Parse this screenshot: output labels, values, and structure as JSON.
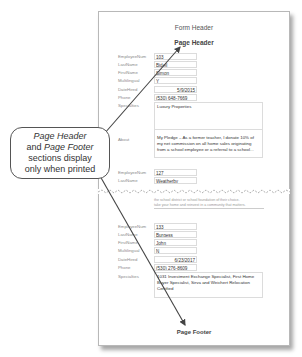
{
  "form": {
    "form_header": "Form Header",
    "page_header": "Page Header",
    "page_footer": "Page Footer"
  },
  "field_labels": {
    "employee_num": "EmployeeNum",
    "last_name": "LastName",
    "first_name": "FirstName",
    "multilingual": "Multilingual",
    "date_hired": "DateHired",
    "phone": "Phone",
    "specialties": "Specialties",
    "about": "About"
  },
  "records": [
    {
      "employee_num": "103",
      "last_name": "Bidell",
      "first_name": "Simon",
      "multilingual": "Y",
      "date_hired": "5/9/2015",
      "phone": "(530) 648-7669",
      "specialties": "Luxury Properties",
      "about": "My Pledge – As a former teacher, I donate 10% of my net commission on all home sales originating from a school employee or a referral to a school..."
    },
    {
      "employee_num": "127",
      "last_name": "Weatherby",
      "first_name": "Holly"
    },
    {
      "employee_num": "133",
      "last_name": "Burgess",
      "first_name": "John",
      "multilingual": "N",
      "date_hired": "6/23/2017",
      "phone": "(530) 276-8609",
      "specialties": "1031 Investment Exchange Specialist, First Home Buyer Specialist, Sirva and Weichert Relocation Certified"
    }
  ],
  "partial_text": {
    "line1": "the school district or school foundation of their choice.",
    "line2": "take your home and reinvest in a community that matters."
  },
  "callout": {
    "line1_italic": "Page Header",
    "line2_prefix": "and ",
    "line2_italic": "Page Footer",
    "line3": "sections display",
    "line4": "only when printed"
  }
}
